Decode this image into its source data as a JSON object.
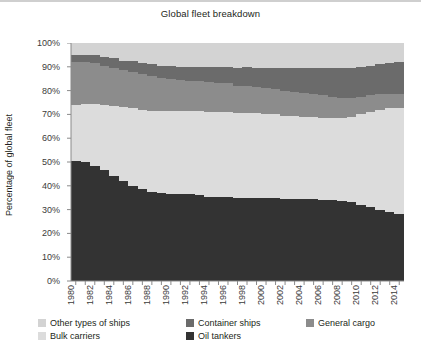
{
  "chart_data": {
    "type": "area",
    "stacked": true,
    "title": "Global fleet breakdown",
    "xlabel": "",
    "ylabel": "Percentage of global fleet",
    "ylim": [
      0,
      100
    ],
    "ytick_labels": [
      "0%",
      "10%",
      "20%",
      "30%",
      "40%",
      "50%",
      "60%",
      "70%",
      "80%",
      "90%",
      "100%"
    ],
    "ytick_values": [
      0,
      10,
      20,
      30,
      40,
      50,
      60,
      70,
      80,
      90,
      100
    ],
    "xlim": [
      1980,
      2014
    ],
    "grid": false,
    "legend_position": "bottom",
    "x": [
      1980,
      1981,
      1982,
      1983,
      1984,
      1985,
      1986,
      1987,
      1988,
      1989,
      1990,
      1991,
      1992,
      1993,
      1994,
      1995,
      1996,
      1997,
      1998,
      1999,
      2000,
      2001,
      2002,
      2003,
      2004,
      2005,
      2006,
      2007,
      2008,
      2009,
      2010,
      2011,
      2012,
      2013,
      2014
    ],
    "xtick_labels": [
      "1980",
      "1982",
      "1984",
      "1986",
      "1988",
      "1990",
      "1992",
      "1994",
      "1996",
      "1998",
      "2000",
      "2002",
      "2004",
      "2006",
      "2008",
      "2010",
      "2012",
      "2014"
    ],
    "series": [
      {
        "name": "Oil tankers",
        "color": "#333333",
        "values": [
          50.5,
          50.0,
          48.5,
          46.5,
          44.0,
          42.0,
          40.0,
          38.5,
          37.5,
          37.0,
          36.5,
          36.5,
          36.5,
          36.0,
          35.5,
          35.5,
          35.5,
          35.0,
          35.0,
          35.0,
          35.0,
          35.0,
          34.5,
          34.5,
          34.5,
          34.5,
          34.0,
          34.0,
          33.5,
          33.0,
          32.0,
          31.0,
          30.0,
          29.0,
          28.0
        ]
      },
      {
        "name": "Bulk carriers",
        "color": "#dcdcdc",
        "values": [
          23.5,
          24.5,
          26.0,
          27.5,
          29.5,
          31.0,
          32.5,
          33.5,
          34.0,
          34.5,
          35.0,
          35.0,
          35.0,
          35.5,
          35.5,
          35.5,
          35.5,
          35.5,
          35.5,
          35.5,
          35.0,
          35.0,
          35.0,
          35.0,
          34.5,
          34.5,
          34.5,
          34.5,
          35.0,
          36.0,
          38.0,
          40.0,
          42.0,
          43.5,
          44.5
        ]
      },
      {
        "name": "General cargo",
        "color": "#8c8c8c",
        "values": [
          18.0,
          17.5,
          17.0,
          16.5,
          16.0,
          15.5,
          15.5,
          15.0,
          14.5,
          14.0,
          13.5,
          13.0,
          12.5,
          12.5,
          12.5,
          12.0,
          12.0,
          11.5,
          11.5,
          11.0,
          11.0,
          10.5,
          10.5,
          10.0,
          10.0,
          9.5,
          9.5,
          9.0,
          8.5,
          8.0,
          7.5,
          7.0,
          6.5,
          6.0,
          6.0
        ]
      },
      {
        "name": "Container ships",
        "color": "#6b6b6b",
        "values": [
          3.0,
          3.0,
          3.5,
          3.5,
          4.0,
          4.0,
          4.5,
          4.5,
          5.0,
          5.0,
          5.5,
          5.5,
          6.0,
          6.0,
          6.5,
          7.0,
          7.0,
          7.5,
          8.0,
          8.0,
          8.5,
          9.0,
          9.5,
          10.0,
          10.5,
          11.0,
          11.5,
          12.0,
          12.5,
          12.5,
          12.5,
          12.5,
          12.5,
          13.0,
          13.5
        ]
      },
      {
        "name": "Other types of ships",
        "color": "#d3d3d3",
        "values": [
          5.0,
          5.0,
          5.0,
          6.0,
          6.5,
          7.5,
          7.5,
          8.5,
          9.0,
          9.5,
          9.5,
          10.0,
          10.0,
          10.0,
          10.0,
          10.0,
          10.0,
          10.5,
          10.0,
          10.5,
          10.5,
          10.5,
          10.5,
          10.5,
          10.5,
          10.5,
          10.5,
          10.5,
          10.5,
          10.5,
          10.0,
          9.5,
          9.0,
          8.5,
          8.0
        ]
      }
    ],
    "legend": [
      {
        "label": "Other types of ships",
        "color": "#d3d3d3"
      },
      {
        "label": "Container ships",
        "color": "#6b6b6b"
      },
      {
        "label": "General cargo",
        "color": "#8c8c8c"
      },
      {
        "label": "Bulk carriers",
        "color": "#dcdcdc"
      },
      {
        "label": "Oil tankers",
        "color": "#333333"
      }
    ]
  }
}
